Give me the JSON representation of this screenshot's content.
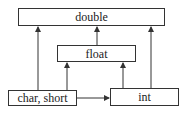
{
  "diagram": {
    "nodes": {
      "double": {
        "label": "double",
        "x": 18,
        "y": 8,
        "w": 147,
        "h": 18
      },
      "float": {
        "label": "float",
        "x": 57,
        "y": 45,
        "w": 79,
        "h": 17
      },
      "char_short": {
        "label": "char, short",
        "x": 8,
        "y": 90,
        "w": 69,
        "h": 16
      },
      "int": {
        "label": "int",
        "x": 110,
        "y": 88,
        "w": 69,
        "h": 18
      }
    },
    "edges": [
      {
        "from": "char, short",
        "to": "double"
      },
      {
        "from": "char, short",
        "to": "float"
      },
      {
        "from": "char, short",
        "to": "int"
      },
      {
        "from": "float",
        "to": "double"
      },
      {
        "from": "int",
        "to": "float"
      },
      {
        "from": "int",
        "to": "double"
      }
    ],
    "colors": {
      "line": "#333333",
      "text": "#222222",
      "background": "#ffffff"
    }
  }
}
